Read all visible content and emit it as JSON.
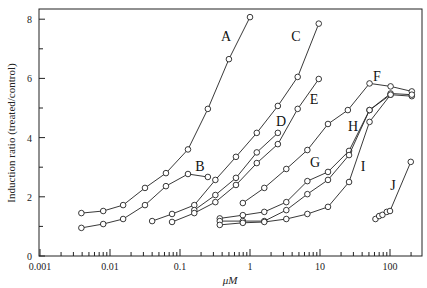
{
  "chart_data": {
    "type": "line",
    "title": "",
    "xlabel": "μM",
    "ylabel": "Induction ratio (treated/control)",
    "xscale": "log",
    "xlim": [
      0.001,
      290
    ],
    "ylim": [
      0,
      8.4
    ],
    "x_ticks": [
      "0.001",
      "0.01",
      "0.1",
      "1",
      "10",
      "100"
    ],
    "y_ticks": [
      "0",
      "2",
      "4",
      "6",
      "8"
    ],
    "grid": false,
    "legend": "inline letter labels",
    "series": [
      {
        "name": "A",
        "x": [
          0.0039,
          0.008,
          0.0154,
          0.0316,
          0.063,
          0.13,
          0.25,
          0.5,
          1.0
        ],
        "values": [
          1.45,
          1.52,
          1.72,
          2.3,
          2.8,
          3.6,
          4.97,
          6.65,
          8.07
        ]
      },
      {
        "name": "B",
        "x": [
          0.0039,
          0.008,
          0.0154,
          0.0316,
          0.063,
          0.13,
          0.25
        ],
        "values": [
          0.95,
          1.08,
          1.25,
          1.72,
          2.36,
          2.77,
          2.67
        ]
      },
      {
        "name": "C",
        "x": [
          0.04,
          0.077,
          0.16,
          0.32,
          0.63,
          1.25,
          2.5,
          4.8,
          9.6
        ],
        "values": [
          1.18,
          1.42,
          1.72,
          2.57,
          3.35,
          4.16,
          5.07,
          6.05,
          7.85
        ]
      },
      {
        "name": "D",
        "x": [
          0.16,
          0.32,
          0.63,
          1.25,
          2.5
        ],
        "values": [
          1.55,
          2.06,
          2.64,
          3.5,
          4.16
        ]
      },
      {
        "name": "E",
        "x": [
          0.077,
          0.16,
          0.32,
          0.63,
          1.25,
          2.5,
          4.8,
          9.6
        ],
        "values": [
          1.15,
          1.45,
          1.82,
          2.4,
          3.14,
          3.78,
          4.97,
          5.98
        ]
      },
      {
        "name": "F",
        "x": [
          0.79,
          1.6,
          3.3,
          6.6,
          13,
          25,
          51,
          102,
          205
        ],
        "values": [
          1.79,
          2.3,
          2.94,
          3.58,
          4.46,
          4.93,
          5.83,
          5.73,
          5.56
        ]
      },
      {
        "name": "G",
        "x": [
          0.37,
          0.79,
          1.6,
          3.3,
          6.6,
          13,
          26,
          51,
          102,
          205
        ],
        "values": [
          1.27,
          1.38,
          1.49,
          1.82,
          2.53,
          2.84,
          3.55,
          4.93,
          5.45,
          5.4
        ]
      },
      {
        "name": "H",
        "x": [
          0.37,
          0.79,
          1.6,
          3.3,
          6.6,
          13,
          26,
          51,
          102,
          205
        ],
        "values": [
          1.18,
          1.18,
          1.18,
          1.55,
          2.09,
          2.57,
          3.41,
          4.93,
          5.49,
          5.45
        ]
      },
      {
        "name": "I",
        "x": [
          0.37,
          0.79,
          1.6,
          3.3,
          6.6,
          13,
          26,
          51,
          102
        ],
        "values": [
          1.05,
          1.12,
          1.15,
          1.25,
          1.42,
          1.66,
          2.5,
          4.53,
          5.45
        ]
      },
      {
        "name": "J",
        "x": [
          62,
          70,
          78,
          90,
          100,
          198
        ],
        "values": [
          1.25,
          1.35,
          1.39,
          1.49,
          1.52,
          3.18
        ]
      }
    ],
    "labels": [
      {
        "text": "A",
        "x": 226,
        "y": 41
      },
      {
        "text": "B",
        "x": 200,
        "y": 171
      },
      {
        "text": "C",
        "x": 296,
        "y": 41
      },
      {
        "text": "D",
        "x": 281,
        "y": 126
      },
      {
        "text": "E",
        "x": 314,
        "y": 104
      },
      {
        "text": "F",
        "x": 377,
        "y": 81
      },
      {
        "text": "G",
        "x": 315,
        "y": 167
      },
      {
        "text": "H",
        "x": 353,
        "y": 131
      },
      {
        "text": "I",
        "x": 363,
        "y": 171
      },
      {
        "text": "J",
        "x": 393,
        "y": 190
      }
    ]
  }
}
